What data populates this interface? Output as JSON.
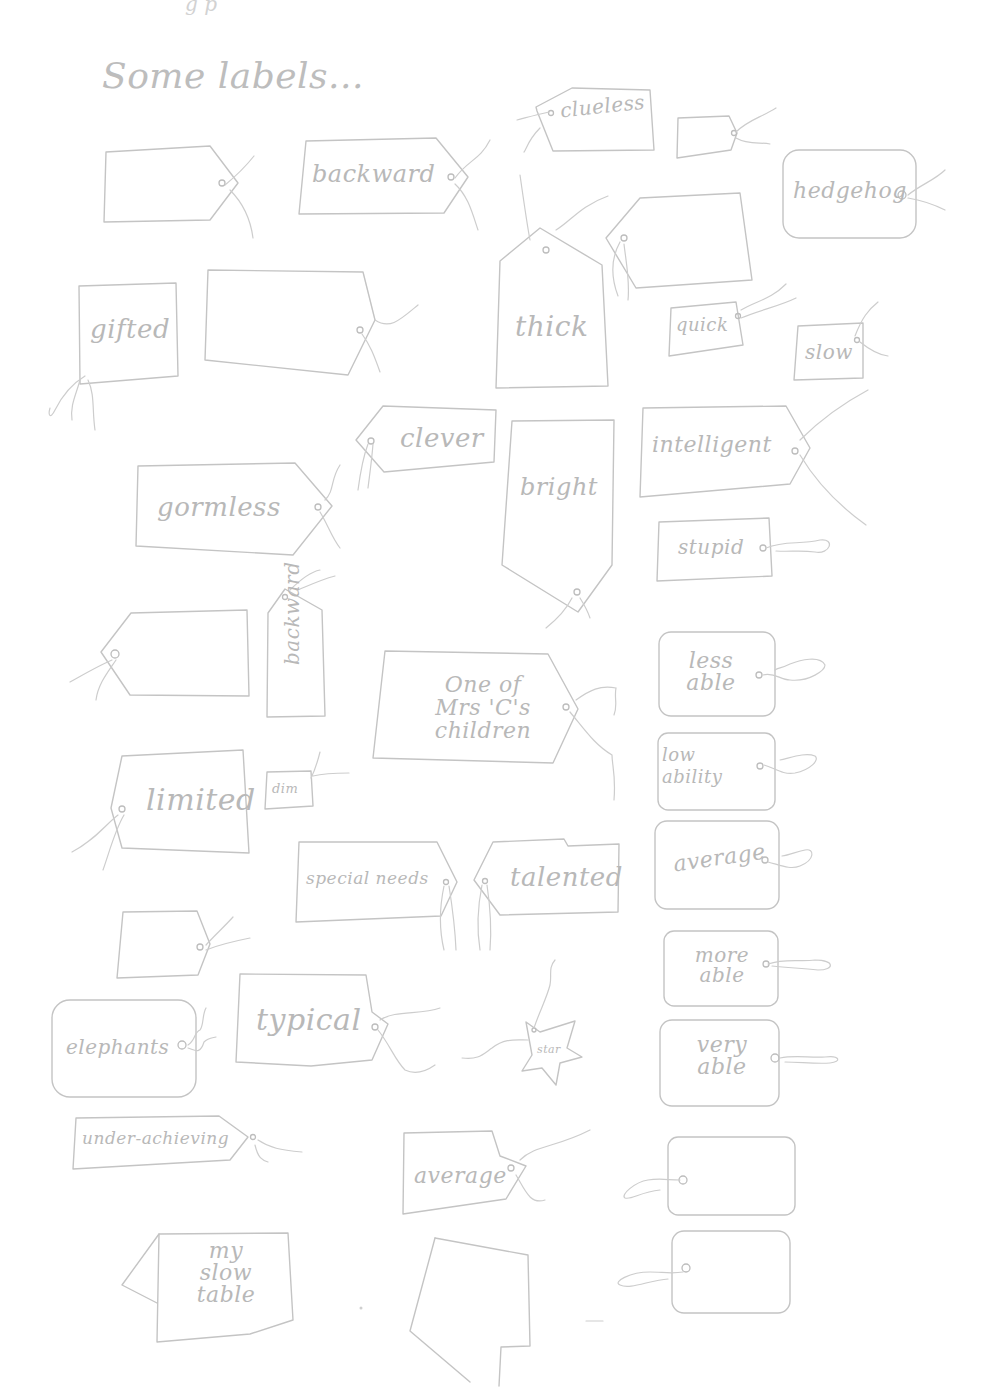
{
  "page": {
    "title": "Some labels...",
    "top_cut_text": "g            p",
    "ink_color": "#c4c4c4",
    "background": "#ffffff"
  },
  "tags": [
    {
      "id": "blank-1",
      "text": ""
    },
    {
      "id": "backward-1",
      "text": "backward"
    },
    {
      "id": "clueless",
      "text": "clueless"
    },
    {
      "id": "blank-2",
      "text": ""
    },
    {
      "id": "hedgehog",
      "text": "hedgehog"
    },
    {
      "id": "thick",
      "text": "thick"
    },
    {
      "id": "blank-3",
      "text": ""
    },
    {
      "id": "gifted",
      "text": "gifted"
    },
    {
      "id": "blank-4",
      "text": ""
    },
    {
      "id": "quick",
      "text": "quick"
    },
    {
      "id": "slow",
      "text": "slow"
    },
    {
      "id": "clever",
      "text": "clever"
    },
    {
      "id": "intelligent",
      "text": "intelligent"
    },
    {
      "id": "gormless",
      "text": "gormless"
    },
    {
      "id": "bright",
      "text": "bright"
    },
    {
      "id": "stupid",
      "text": "stupid"
    },
    {
      "id": "blank-5",
      "text": ""
    },
    {
      "id": "backward-2",
      "text": "backward"
    },
    {
      "id": "one-of-mrs-cs-children",
      "text": "One of\nMrs 'C's\nchildren"
    },
    {
      "id": "less-able",
      "text": "less\nable"
    },
    {
      "id": "low-ability",
      "text": "low\nability"
    },
    {
      "id": "limited",
      "text": "limited"
    },
    {
      "id": "dim",
      "text": "dim"
    },
    {
      "id": "special-needs",
      "text": "special needs"
    },
    {
      "id": "talented",
      "text": "talented"
    },
    {
      "id": "average-1",
      "text": "average"
    },
    {
      "id": "blank-6",
      "text": ""
    },
    {
      "id": "more-able",
      "text": "more\nable"
    },
    {
      "id": "elephants",
      "text": "elephants"
    },
    {
      "id": "typical",
      "text": "typical"
    },
    {
      "id": "star",
      "text": "star"
    },
    {
      "id": "very-able",
      "text": "very\nable"
    },
    {
      "id": "under-achieving",
      "text": "under-achieving"
    },
    {
      "id": "average-2",
      "text": "average"
    },
    {
      "id": "blank-7",
      "text": ""
    },
    {
      "id": "my-slow-table",
      "text": "my\nslow\ntable"
    },
    {
      "id": "blank-tent-card",
      "text": ""
    },
    {
      "id": "blank-8",
      "text": ""
    }
  ]
}
